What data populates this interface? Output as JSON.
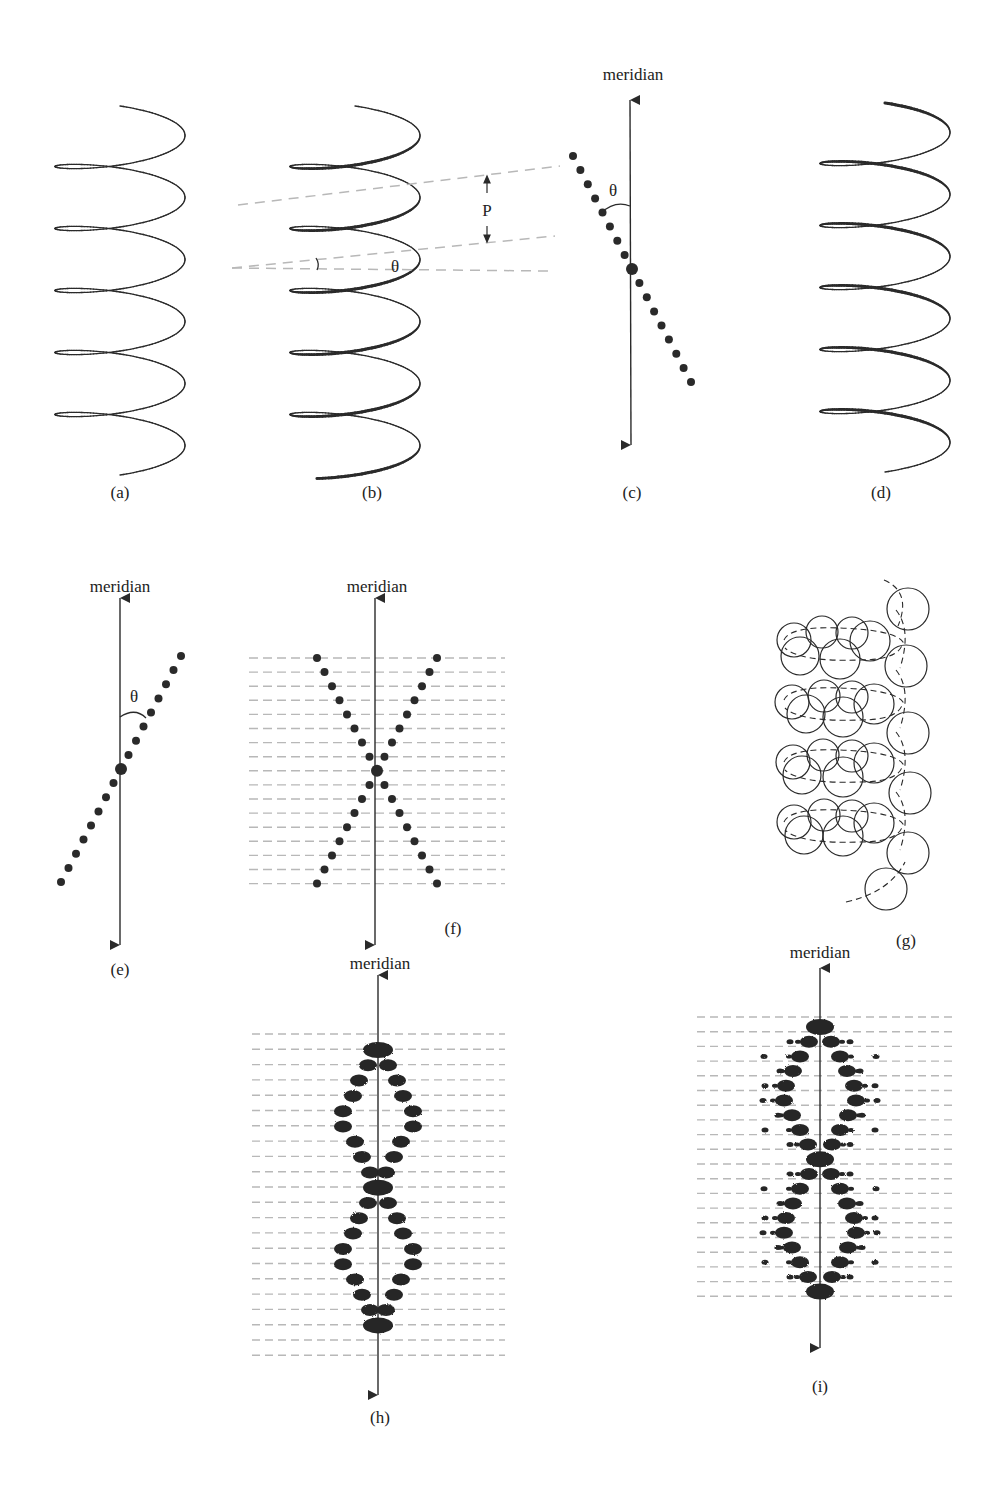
{
  "figure": {
    "ink_color": "#2a2a2a",
    "dash_color": "#b8b8b8",
    "axis_label": "meridian",
    "theta": "θ",
    "pitch": "P",
    "panels": [
      {
        "id": "a",
        "label": "(a)",
        "description": "continuous helix"
      },
      {
        "id": "b",
        "label": "(b)",
        "description": "helix with pitch P and pitch angle θ"
      },
      {
        "id": "c",
        "label": "(c)",
        "description": "row of points tilted at θ to meridian"
      },
      {
        "id": "d",
        "label": "(d)",
        "description": "helix viewed from opposite side"
      },
      {
        "id": "e",
        "label": "(e)",
        "description": "row of points tilted at -θ to meridian"
      },
      {
        "id": "f",
        "label": "(f)",
        "description": "X-shaped pattern of points on layer lines"
      },
      {
        "id": "g",
        "label": "(g)",
        "description": "discontinuous helix of spherical subunits"
      },
      {
        "id": "h",
        "label": "(h)",
        "description": "diffraction pattern of continuous helix"
      },
      {
        "id": "i",
        "label": "(i)",
        "description": "diffraction pattern of discontinuous helix"
      }
    ]
  }
}
